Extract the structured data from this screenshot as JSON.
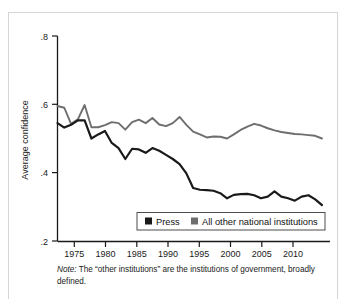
{
  "figure": {
    "note_prefix": "Note:",
    "note_text": " The “other institutions” are the institutions of government, broadly defined."
  },
  "legend": {
    "items": [
      {
        "label": "Press",
        "color": "#1a1a1a",
        "marker": "filled-square-marker"
      },
      {
        "label": "All other national institutions",
        "color": "#6e6e6e",
        "marker": "filled-square-marker"
      }
    ]
  },
  "axes": {
    "y_label": "Average confidence",
    "y_ticks": [
      ".8",
      ".6",
      ".4",
      ".2"
    ],
    "x_ticks": [
      "1975",
      "1980",
      "1985",
      "1990",
      "1995",
      "2000",
      "2005",
      "2010"
    ]
  },
  "chart_data": {
    "type": "line",
    "title": "",
    "xlabel": "",
    "ylabel": "Average confidence",
    "xlim": [
      1973,
      2012
    ],
    "ylim": [
      0.2,
      0.8
    ],
    "grid": false,
    "legend_position": "bottom-center",
    "x": [
      1973,
      1974,
      1975,
      1976,
      1977,
      1978,
      1979,
      1980,
      1981,
      1982,
      1983,
      1984,
      1985,
      1986,
      1987,
      1988,
      1989,
      1990,
      1991,
      1992,
      1993,
      1994,
      1995,
      1996,
      1997,
      1998,
      1999,
      2000,
      2001,
      2002,
      2003,
      2004,
      2005,
      2006,
      2007,
      2008,
      2009,
      2010,
      2011,
      2012
    ],
    "series": [
      {
        "name": "Press",
        "color": "#1a1a1a",
        "values": [
          0.545,
          0.532,
          0.54,
          0.553,
          0.553,
          0.5,
          0.512,
          0.522,
          0.487,
          0.472,
          0.44,
          0.47,
          0.468,
          0.458,
          0.472,
          0.464,
          0.452,
          0.44,
          0.425,
          0.398,
          0.355,
          0.35,
          0.349,
          0.347,
          0.34,
          0.325,
          0.335,
          0.337,
          0.338,
          0.334,
          0.325,
          0.33,
          0.345,
          0.33,
          0.325,
          0.318,
          0.33,
          0.334,
          0.322,
          0.305
        ]
      },
      {
        "name": "All other national institutions",
        "color": "#6e6e6e",
        "values": [
          0.595,
          0.59,
          0.543,
          0.556,
          0.598,
          0.533,
          0.533,
          0.539,
          0.548,
          0.545,
          0.526,
          0.548,
          0.555,
          0.545,
          0.56,
          0.541,
          0.536,
          0.545,
          0.563,
          0.54,
          0.52,
          0.512,
          0.503,
          0.506,
          0.505,
          0.5,
          0.512,
          0.525,
          0.535,
          0.543,
          0.538,
          0.53,
          0.524,
          0.519,
          0.516,
          0.513,
          0.512,
          0.51,
          0.508,
          0.5
        ]
      }
    ]
  }
}
